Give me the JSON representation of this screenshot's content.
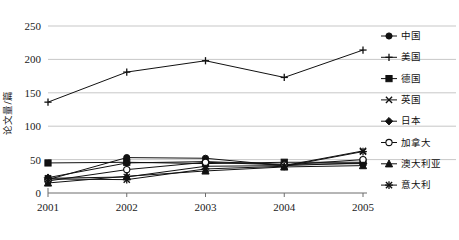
{
  "chart_data": {
    "type": "line",
    "title": "",
    "xlabel": "",
    "ylabel": "论文量/篇",
    "categories": [
      "2001",
      "2002",
      "2003",
      "2004",
      "2005"
    ],
    "x_tick_labels": [
      "2001",
      "2002",
      "2003",
      "2004",
      "2005"
    ],
    "y_tick_labels": [
      "0",
      "50",
      "100",
      "150",
      "200",
      "250"
    ],
    "y_ticks": [
      0,
      50,
      100,
      150,
      200,
      250
    ],
    "ylim": [
      0,
      250
    ],
    "grid": "horizontal",
    "legend_position": "right",
    "series": [
      {
        "name": "中国",
        "marker": "filled-circle",
        "values": [
          20,
          53,
          52,
          41,
          45
        ]
      },
      {
        "name": "美国",
        "marker": "plus",
        "values": [
          136,
          181,
          198,
          173,
          214
        ]
      },
      {
        "name": "德国",
        "marker": "filled-square",
        "values": [
          45,
          46,
          44,
          46,
          46
        ]
      },
      {
        "name": "英国",
        "marker": "x-cross",
        "values": [
          22,
          24,
          40,
          41,
          63
        ]
      },
      {
        "name": "日本",
        "marker": "filled-diamond",
        "values": [
          23,
          45,
          47,
          43,
          44
        ]
      },
      {
        "name": "加拿大",
        "marker": "open-circle",
        "values": [
          18,
          35,
          46,
          42,
          50
        ]
      },
      {
        "name": "澳大利亚",
        "marker": "filled-triangle",
        "values": [
          15,
          25,
          33,
          39,
          41
        ]
      },
      {
        "name": "意大利",
        "marker": "asterisk",
        "values": [
          21,
          20,
          36,
          40,
          62
        ]
      }
    ]
  },
  "legend": {
    "items": [
      {
        "label": "中国"
      },
      {
        "label": "美国"
      },
      {
        "label": "德国"
      },
      {
        "label": "英国"
      },
      {
        "label": "日本"
      },
      {
        "label": "加拿大"
      },
      {
        "label": "澳大利亚"
      },
      {
        "label": "意大利"
      }
    ]
  },
  "colors": {
    "ink": "#111111",
    "grid": "#b9b9b9",
    "axis": "#6d6d6d",
    "background": "#ffffff"
  }
}
